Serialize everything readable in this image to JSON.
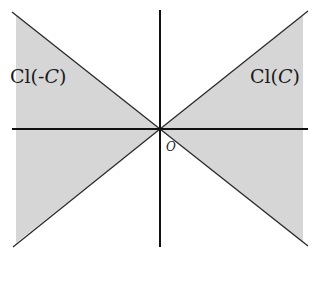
{
  "diagram": {
    "labels": {
      "left_cone_prefix": "Cl(-",
      "left_cone_var": "C",
      "left_cone_suffix": ")",
      "right_cone_prefix": "Cl(",
      "right_cone_var": "C",
      "right_cone_suffix": ")",
      "origin": "O"
    },
    "colors": {
      "shade": "#d6d6d6",
      "line": "#2a2a2a",
      "axis": "#111111",
      "background": "#ffffff"
    },
    "geometry": {
      "origin": [
        160,
        129
      ],
      "region_left_x": 16,
      "region_right_x": 303,
      "top_y": 12,
      "bottom_y": 247
    }
  }
}
